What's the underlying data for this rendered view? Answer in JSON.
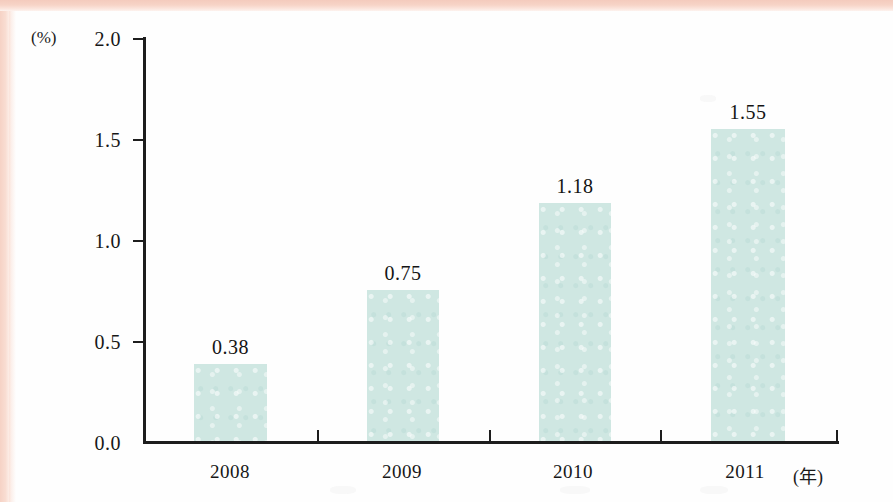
{
  "chart_data": {
    "type": "bar",
    "title": "",
    "subtitle": "",
    "xlabel": "(年)",
    "ylabel": "(%)",
    "categories": [
      "2008",
      "2009",
      "2010",
      "2011"
    ],
    "values": [
      0.38,
      0.75,
      1.18,
      1.55
    ],
    "value_labels": [
      "0.38",
      "0.75",
      "1.18",
      "1.55"
    ],
    "ylim": [
      0.0,
      2.0
    ],
    "ytick_labels": [
      "2.0",
      "1.5",
      "1.0",
      "0.5",
      "0.0"
    ],
    "ytick_values": [
      2.0,
      1.5,
      1.0,
      0.5,
      0.0
    ],
    "grid": false,
    "legend": null,
    "series": [
      {
        "name": "",
        "values": [
          0.38,
          0.75,
          1.18,
          1.55
        ],
        "color": "#cfe7e2"
      }
    ],
    "colors": {
      "bar_fill": "#cfe7e2",
      "axis": "#1d1d1d",
      "text": "#171717",
      "page_edge": "#f6d2c5",
      "paper": "#fefefe"
    }
  }
}
